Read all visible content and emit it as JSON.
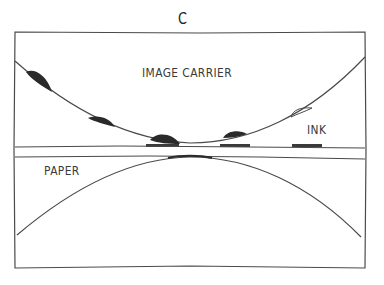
{
  "figure": {
    "panel_label": "C",
    "labels": {
      "image_carrier": "IMAGE CARRIER",
      "ink": "INK",
      "paper": "PAPER"
    },
    "colors": {
      "line": "#4a4a4a",
      "ink": "#2a2a2a",
      "background": "#ffffff"
    }
  }
}
